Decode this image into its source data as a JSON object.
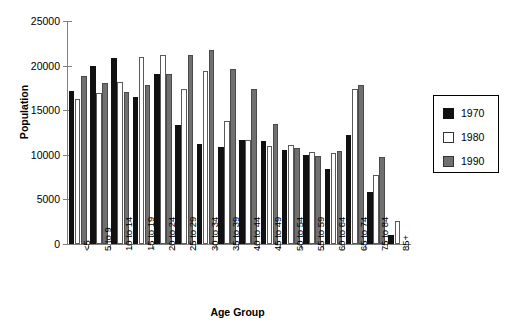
{
  "chart_data": {
    "type": "bar",
    "title": "",
    "xlabel": "Age Group",
    "ylabel": "Population",
    "ylim": [
      0,
      25000
    ],
    "yticks": [
      0,
      5000,
      10000,
      15000,
      20000,
      25000
    ],
    "ytick_labels": [
      "0",
      "5000",
      "10000",
      "15000",
      "20000",
      "25000"
    ],
    "grid": false,
    "legend_position": "right",
    "categories": [
      "<5",
      "5 to 9",
      "10 to 14",
      "15 to 19",
      "20 to 24",
      "25 to 29",
      "30 to 34",
      "35 to 39",
      "40 to 44",
      "45 to 49",
      "50 to 54",
      "55 to 59",
      "60 to 64",
      "65 to 74",
      "75 to 84",
      "85+"
    ],
    "series": [
      {
        "name": "1970",
        "color": "#111111",
        "values": [
          17100,
          20000,
          20800,
          16500,
          19100,
          13300,
          11200,
          10900,
          11700,
          11500,
          10500,
          10000,
          8400,
          12200,
          5800,
          1000
        ]
      },
      {
        "name": "1980",
        "color": "#ffffff",
        "values": [
          16300,
          16900,
          18200,
          21000,
          21200,
          17400,
          19400,
          13800,
          11700,
          11000,
          11100,
          10300,
          10200,
          17400,
          7700,
          2600
        ]
      },
      {
        "name": "1990",
        "color": "#707070",
        "values": [
          18800,
          18000,
          17000,
          17800,
          19100,
          21200,
          21700,
          19600,
          17400,
          13500,
          10800,
          9900,
          10400,
          17800,
          9700,
          0
        ]
      }
    ]
  },
  "legend": {
    "items": [
      {
        "label": "1970",
        "swatch": "black-square-swatch"
      },
      {
        "label": "1980",
        "swatch": "white-square-swatch"
      },
      {
        "label": "1990",
        "swatch": "gray-square-swatch"
      }
    ]
  }
}
